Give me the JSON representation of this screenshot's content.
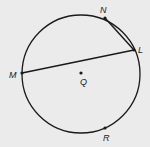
{
  "diagram": {
    "type": "circle-geometry",
    "background": "#ebebeb",
    "stroke_color": "#1a1a1a",
    "circle": {
      "center_label": "Q",
      "cx": 81,
      "cy": 74,
      "r": 59
    },
    "points": {
      "N": {
        "label": "N",
        "x": 105,
        "y": 18
      },
      "L": {
        "label": "L",
        "x": 134,
        "y": 50
      },
      "M": {
        "label": "M",
        "x": 22,
        "y": 73
      },
      "Q": {
        "label": "Q",
        "x": 81,
        "y": 73
      },
      "R": {
        "label": "R",
        "x": 105,
        "y": 128
      }
    },
    "segments": [
      {
        "from": "M",
        "to": "L",
        "kind": "chord"
      },
      {
        "from": "N",
        "to": "L",
        "kind": "chord"
      }
    ]
  }
}
